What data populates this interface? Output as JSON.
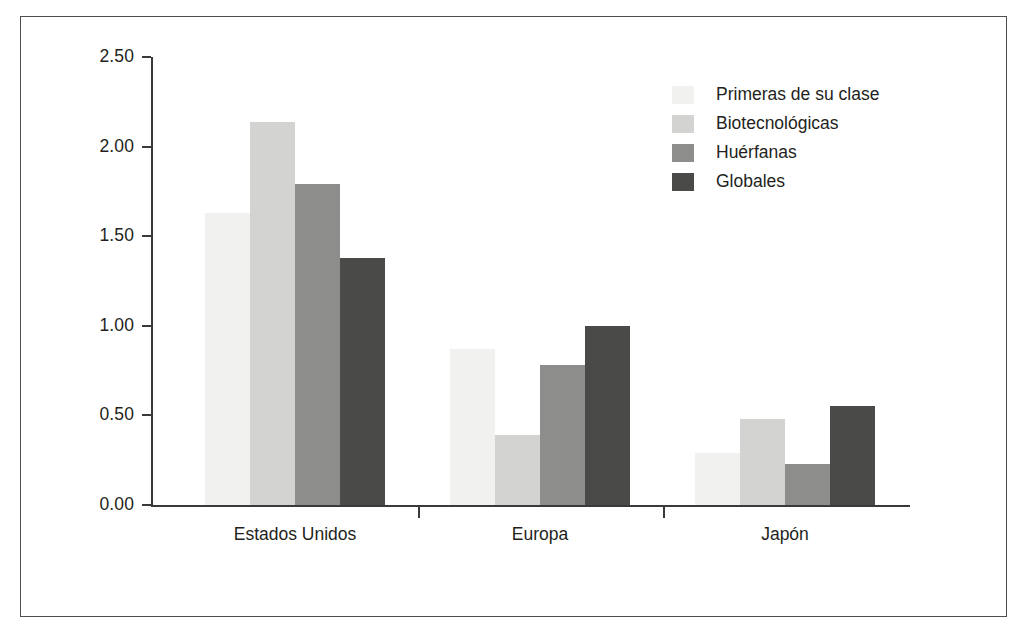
{
  "chart_data": {
    "type": "bar",
    "title": "",
    "subtitle": "",
    "xlabel": "",
    "ylabel": "",
    "categories": [
      "Estados Unidos",
      "Europa",
      "Japón"
    ],
    "series": [
      {
        "name": "Primeras de su clase",
        "color": "#f1f1ef",
        "values": [
          1.63,
          0.87,
          0.29
        ]
      },
      {
        "name": "Biotecnológicas",
        "color": "#d3d3d1",
        "values": [
          2.14,
          0.39,
          0.48
        ]
      },
      {
        "name": "Huérfanas",
        "color": "#8d8d8b",
        "values": [
          1.79,
          0.78,
          0.23
        ]
      },
      {
        "name": "Globales",
        "color": "#4a4a48",
        "values": [
          1.38,
          1.0,
          0.55
        ]
      }
    ],
    "ylim": [
      0.0,
      2.5
    ],
    "ytick_labels": [
      "0.00",
      "0.50",
      "1.00",
      "1.50",
      "2.00",
      "2.50"
    ],
    "ytick_values": [
      0.0,
      0.5,
      1.0,
      1.5,
      2.0,
      2.5
    ],
    "grid": false,
    "legend_position": "top-right",
    "legend_entries": [
      "Primeras de su clase",
      "Biotecnológicas",
      "Huérfanas",
      "Globales"
    ],
    "annotations": []
  },
  "figure": {
    "frame_color": "#4f4f52",
    "axis_color": "#3a3a3c",
    "background": "#ffffff",
    "text_color": "#231f20"
  }
}
